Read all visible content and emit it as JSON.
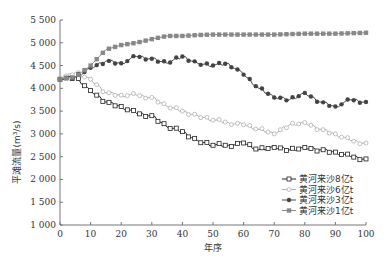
{
  "chart_data": {
    "type": "line",
    "title": "",
    "xlabel": "年序",
    "ylabel": "平滩流量(m³/s)",
    "xlim": [
      0,
      100
    ],
    "ylim": [
      1000,
      5500
    ],
    "x_ticks": [
      0,
      10,
      20,
      30,
      40,
      50,
      60,
      70,
      80,
      90,
      100
    ],
    "y_ticks": [
      1000,
      1500,
      2000,
      2500,
      3000,
      3500,
      4000,
      4500,
      5000,
      5500
    ],
    "y_tick_labels": [
      "1 000",
      "1 500",
      "2 000",
      "2 500",
      "3 000",
      "3 500",
      "4 000",
      "4 500",
      "5 000",
      "5 500"
    ],
    "grid": false,
    "legend_position": "lower right",
    "x": [
      0,
      5,
      10,
      15,
      20,
      25,
      30,
      35,
      40,
      45,
      50,
      55,
      60,
      65,
      70,
      75,
      80,
      85,
      90,
      95,
      100
    ],
    "series": [
      {
        "name": "黄河来沙8亿t",
        "color": "#222222",
        "marker": "open-square",
        "values": [
          4200,
          4250,
          3950,
          3700,
          3600,
          3450,
          3400,
          3150,
          3050,
          2850,
          2750,
          2750,
          2800,
          2650,
          2700,
          2650,
          2700,
          2650,
          2600,
          2500,
          2450
        ]
      },
      {
        "name": "黄河来沙6亿t",
        "color": "#b0b0b0",
        "marker": "open-circle",
        "values": [
          4200,
          4350,
          4200,
          3900,
          3850,
          3850,
          3800,
          3600,
          3500,
          3400,
          3300,
          3250,
          3200,
          3100,
          3000,
          3200,
          3250,
          3100,
          3000,
          2850,
          2800
        ]
      },
      {
        "name": "黄河来沙3亿t",
        "color": "#444444",
        "marker": "filled-circle",
        "values": [
          4200,
          4250,
          4450,
          4600,
          4550,
          4700,
          4650,
          4550,
          4700,
          4550,
          4500,
          4550,
          4300,
          4000,
          3800,
          3750,
          3900,
          3700,
          3600,
          3750,
          3700
        ]
      },
      {
        "name": "黄河来沙1亿t",
        "color": "#888888",
        "marker": "filled-square",
        "values": [
          4200,
          4250,
          4500,
          4850,
          4950,
          5000,
          5080,
          5150,
          5150,
          5170,
          5180,
          5180,
          5180,
          5180,
          5180,
          5190,
          5200,
          5200,
          5200,
          5210,
          5220
        ]
      }
    ]
  }
}
